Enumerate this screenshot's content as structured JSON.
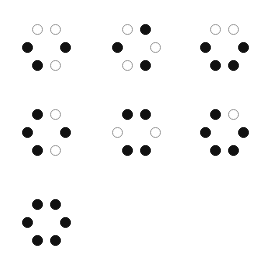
{
  "figure": {
    "background_color": "#ffffff",
    "filled_color": "#111111",
    "open_fill_color": "#ffffff",
    "open_stroke_color": "#9a9a9a",
    "dot_diameter_px": 11,
    "canvas": {
      "width": 263,
      "height": 270
    },
    "slot_order": [
      "top-left",
      "top-right",
      "middle-left",
      "middle-right",
      "bottom-left",
      "bottom-right"
    ],
    "patterns": [
      {
        "id": "pattern-1",
        "row": 1,
        "column": 1,
        "x": 18,
        "y": 24,
        "filled_count": 3,
        "open_count": 3,
        "dots": [
          {
            "slot": "top-left",
            "state": "open"
          },
          {
            "slot": "top-right",
            "state": "open"
          },
          {
            "slot": "middle-left",
            "state": "filled"
          },
          {
            "slot": "middle-right",
            "state": "filled"
          },
          {
            "slot": "bottom-left",
            "state": "filled"
          },
          {
            "slot": "bottom-right",
            "state": "open"
          }
        ]
      },
      {
        "id": "pattern-2",
        "row": 1,
        "column": 2,
        "x": 108,
        "y": 24,
        "filled_count": 3,
        "open_count": 3,
        "dots": [
          {
            "slot": "top-left",
            "state": "open"
          },
          {
            "slot": "top-right",
            "state": "filled"
          },
          {
            "slot": "middle-left",
            "state": "filled"
          },
          {
            "slot": "middle-right",
            "state": "open"
          },
          {
            "slot": "bottom-left",
            "state": "open"
          },
          {
            "slot": "bottom-right",
            "state": "filled"
          }
        ]
      },
      {
        "id": "pattern-3",
        "row": 1,
        "column": 3,
        "x": 196,
        "y": 24,
        "filled_count": 4,
        "open_count": 2,
        "dots": [
          {
            "slot": "top-left",
            "state": "open"
          },
          {
            "slot": "top-right",
            "state": "open"
          },
          {
            "slot": "middle-left",
            "state": "filled"
          },
          {
            "slot": "middle-right",
            "state": "filled"
          },
          {
            "slot": "bottom-left",
            "state": "filled"
          },
          {
            "slot": "bottom-right",
            "state": "filled"
          }
        ]
      },
      {
        "id": "pattern-4",
        "row": 2,
        "column": 1,
        "x": 18,
        "y": 109,
        "filled_count": 4,
        "open_count": 2,
        "dots": [
          {
            "slot": "top-left",
            "state": "filled"
          },
          {
            "slot": "top-right",
            "state": "open"
          },
          {
            "slot": "middle-left",
            "state": "filled"
          },
          {
            "slot": "middle-right",
            "state": "filled"
          },
          {
            "slot": "bottom-left",
            "state": "filled"
          },
          {
            "slot": "bottom-right",
            "state": "open"
          }
        ]
      },
      {
        "id": "pattern-5",
        "row": 2,
        "column": 2,
        "x": 108,
        "y": 109,
        "filled_count": 4,
        "open_count": 2,
        "dots": [
          {
            "slot": "top-left",
            "state": "filled"
          },
          {
            "slot": "top-right",
            "state": "filled"
          },
          {
            "slot": "middle-left",
            "state": "open"
          },
          {
            "slot": "middle-right",
            "state": "open"
          },
          {
            "slot": "bottom-left",
            "state": "filled"
          },
          {
            "slot": "bottom-right",
            "state": "filled"
          }
        ]
      },
      {
        "id": "pattern-6",
        "row": 2,
        "column": 3,
        "x": 196,
        "y": 109,
        "filled_count": 5,
        "open_count": 1,
        "dots": [
          {
            "slot": "top-left",
            "state": "filled"
          },
          {
            "slot": "top-right",
            "state": "open"
          },
          {
            "slot": "middle-left",
            "state": "filled"
          },
          {
            "slot": "middle-right",
            "state": "filled"
          },
          {
            "slot": "bottom-left",
            "state": "filled"
          },
          {
            "slot": "bottom-right",
            "state": "filled"
          }
        ]
      },
      {
        "id": "pattern-7",
        "row": 3,
        "column": 1,
        "x": 18,
        "y": 199,
        "filled_count": 6,
        "open_count": 0,
        "dots": [
          {
            "slot": "top-left",
            "state": "filled"
          },
          {
            "slot": "top-right",
            "state": "filled"
          },
          {
            "slot": "middle-left",
            "state": "filled"
          },
          {
            "slot": "middle-right",
            "state": "filled"
          },
          {
            "slot": "bottom-left",
            "state": "filled"
          },
          {
            "slot": "bottom-right",
            "state": "filled"
          }
        ]
      }
    ]
  }
}
